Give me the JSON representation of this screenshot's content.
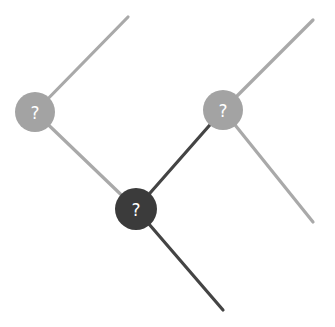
{
  "diagram": {
    "type": "tree",
    "colors": {
      "background": "#ffffff",
      "light_edge": "#a9a9a9",
      "dark_edge": "#444444",
      "light_node": "#a3a3a3",
      "dark_node": "#3b3b3b",
      "label": "#ffffff"
    },
    "nodes": [
      {
        "id": "left",
        "label": "?",
        "cx": 35,
        "cy": 112,
        "r": 20,
        "shade": "light"
      },
      {
        "id": "center",
        "label": "?",
        "cx": 136,
        "cy": 209,
        "r": 21,
        "shade": "dark"
      },
      {
        "id": "right",
        "label": "?",
        "cx": 223,
        "cy": 110,
        "r": 20,
        "shade": "light"
      }
    ],
    "edges": [
      {
        "from": "left",
        "to": "top-left-end",
        "x1": 35,
        "y1": 112,
        "x2": 128,
        "y2": 17,
        "shade": "light"
      },
      {
        "from": "left",
        "to": "center",
        "x1": 35,
        "y1": 112,
        "x2": 136,
        "y2": 209,
        "shade": "light"
      },
      {
        "from": "center",
        "to": "right",
        "x1": 136,
        "y1": 209,
        "x2": 223,
        "y2": 110,
        "shade": "dark"
      },
      {
        "from": "center",
        "to": "bottom-end",
        "x1": 136,
        "y1": 209,
        "x2": 223,
        "y2": 310,
        "shade": "dark"
      },
      {
        "from": "right",
        "to": "top-right-end",
        "x1": 223,
        "y1": 110,
        "x2": 313,
        "y2": 20,
        "shade": "light"
      },
      {
        "from": "right",
        "to": "lower-right-end",
        "x1": 223,
        "y1": 110,
        "x2": 313,
        "y2": 222,
        "shade": "light"
      }
    ]
  }
}
